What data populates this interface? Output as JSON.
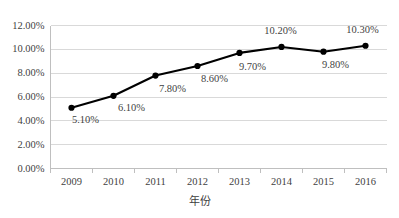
{
  "chart_data": {
    "type": "line",
    "title": "",
    "subtitle": "",
    "xlabel": "年份",
    "ylabel": "",
    "categories": [
      "2009",
      "2010",
      "2011",
      "2012",
      "2013",
      "2014",
      "2015",
      "2016"
    ],
    "values": [
      5.1,
      6.1,
      7.8,
      8.6,
      9.7,
      10.2,
      9.8,
      10.3
    ],
    "point_labels": [
      "5.10%",
      "6.10%",
      "7.80%",
      "8.60%",
      "9.70%",
      "10.20%",
      "9.80%",
      "10.30%"
    ],
    "series": [
      {
        "name": "",
        "values": [
          5.1,
          6.1,
          7.8,
          8.6,
          9.7,
          10.2,
          9.8,
          10.3
        ],
        "line_color": "#000000",
        "marker_color": "#000000",
        "marker": "circle"
      }
    ],
    "ylim": [
      0,
      12
    ],
    "ytick_values": [
      0,
      2,
      4,
      6,
      8,
      10,
      12
    ],
    "ytick_labels": [
      "0.00%",
      "2.00%",
      "4.00%",
      "6.00%",
      "8.00%",
      "10.00%",
      "12.00%"
    ],
    "xtick_labels": [
      "2009",
      "2010",
      "2011",
      "2012",
      "2013",
      "2014",
      "2015",
      "2016"
    ],
    "grid": true,
    "grid_axis": "y",
    "grid_color": "#d9d9d9",
    "axis_color": "#bfbfbf",
    "legend": false,
    "legend_position": "none",
    "background_color": "#ffffff",
    "text_color": "#3f3f3f",
    "data_labels_shown": true,
    "units": "percent"
  },
  "label_offsets": [
    {
      "dx": 14,
      "dy": 12
    },
    {
      "dx": 18,
      "dy": 12
    },
    {
      "dx": 17,
      "dy": 13
    },
    {
      "dx": 17,
      "dy": 13
    },
    {
      "dx": 13,
      "dy": 14
    },
    {
      "dx": -1,
      "dy": -16
    },
    {
      "dx": 12,
      "dy": 13
    },
    {
      "dx": -3,
      "dy": -16
    }
  ]
}
